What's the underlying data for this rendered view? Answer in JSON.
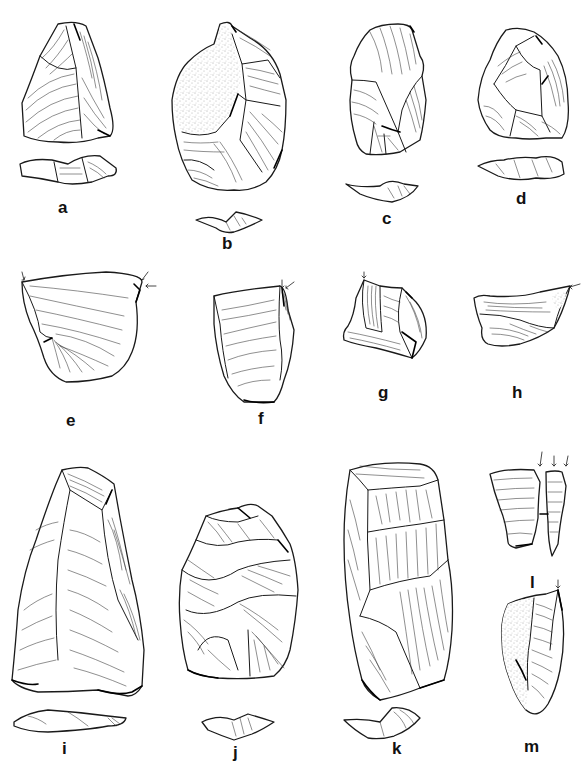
{
  "figure": {
    "type": "lithic artifact illustration plate",
    "artifacts": [
      {
        "id": "a",
        "label": "a",
        "views": [
          "dorsal",
          "profile"
        ]
      },
      {
        "id": "b",
        "label": "b",
        "views": [
          "dorsal",
          "profile"
        ],
        "cortex": true
      },
      {
        "id": "c",
        "label": "c",
        "views": [
          "dorsal",
          "profile"
        ]
      },
      {
        "id": "d",
        "label": "d",
        "views": [
          "dorsal",
          "profile"
        ]
      },
      {
        "id": "e",
        "label": "e",
        "views": [
          "dorsal"
        ],
        "burin_blow_arrows": 2
      },
      {
        "id": "f",
        "label": "f",
        "views": [
          "dorsal"
        ],
        "burin_blow_arrows": 2
      },
      {
        "id": "g",
        "label": "g",
        "views": [
          "dorsal"
        ],
        "burin_blow_arrows": 1
      },
      {
        "id": "h",
        "label": "h",
        "views": [
          "dorsal"
        ],
        "burin_blow_arrows": 1
      },
      {
        "id": "i",
        "label": "i",
        "views": [
          "dorsal",
          "profile"
        ]
      },
      {
        "id": "j",
        "label": "j",
        "views": [
          "dorsal",
          "profile"
        ]
      },
      {
        "id": "k",
        "label": "k",
        "views": [
          "dorsal",
          "profile"
        ]
      },
      {
        "id": "l",
        "label": "l",
        "views": [
          "dorsal",
          "spall"
        ],
        "burin_blow_arrows": 3
      },
      {
        "id": "m",
        "label": "m",
        "views": [
          "dorsal"
        ],
        "cortex": true,
        "burin_blow_arrows": 1
      }
    ]
  }
}
